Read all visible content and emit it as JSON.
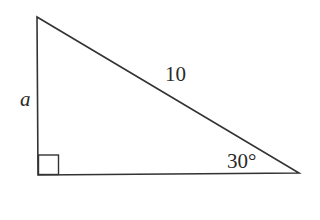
{
  "diagram": {
    "type": "right-triangle",
    "stroke_color": "#333333",
    "background": "#ffffff",
    "vertices": {
      "top": [
        37,
        17
      ],
      "right_angle": [
        38,
        175
      ],
      "acute": [
        299,
        173
      ]
    },
    "right_angle_marker": {
      "x": 38,
      "y": 155,
      "size": 20
    },
    "labels": {
      "vertical_leg": "a",
      "hypotenuse": "10",
      "angle": "30°"
    }
  }
}
